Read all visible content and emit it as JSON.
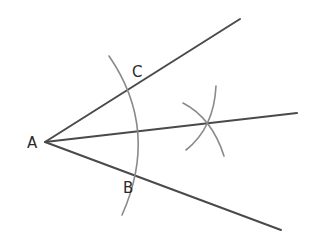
{
  "diagram": {
    "colors": {
      "ray": "#4a4a4a",
      "arc": "#8a8a8a",
      "label": "#2a2a2a",
      "background": "#ffffff"
    },
    "points": {
      "A": {
        "label": "A",
        "x": 45,
        "y": 142
      },
      "B": {
        "label": "B",
        "x": 145,
        "y": 180
      },
      "C": {
        "label": "C",
        "x": 137,
        "y": 86
      },
      "bisector_intersection": {
        "x": 207,
        "y": 123
      }
    },
    "rays": [
      {
        "name": "upper-ray",
        "from": [
          45,
          142
        ],
        "to": [
          240,
          19
        ]
      },
      {
        "name": "bisector-ray",
        "from": [
          45,
          142
        ],
        "to": [
          297,
          113
        ]
      },
      {
        "name": "lower-ray",
        "from": [
          45,
          142
        ],
        "to": [
          281,
          230
        ]
      }
    ],
    "arcs": [
      {
        "name": "main-arc",
        "center": "A",
        "through": [
          "C",
          "B"
        ]
      },
      {
        "name": "arc-from-c",
        "center": "C"
      },
      {
        "name": "arc-from-b",
        "center": "B"
      }
    ],
    "labels": {
      "A": "A",
      "B": "B",
      "C": "C"
    }
  }
}
